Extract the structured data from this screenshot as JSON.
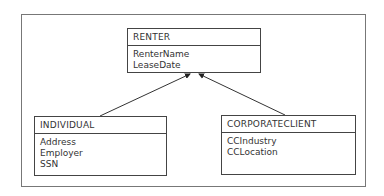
{
  "diagram": {
    "type": "er-inheritance",
    "entities": [
      {
        "name": "RENTER",
        "attributes": [
          "RenterName",
          "LeaseDate"
        ]
      },
      {
        "name": "INDIVIDUAL",
        "attributes": [
          "Address",
          "Employer",
          "SSN"
        ]
      },
      {
        "name": "CORPORATECLIENT",
        "attributes": [
          "CCIndustry",
          "CCLocation"
        ]
      }
    ],
    "relationships": [
      {
        "from": "INDIVIDUAL",
        "to": "RENTER",
        "kind": "generalization"
      },
      {
        "from": "CORPORATECLIENT",
        "to": "RENTER",
        "kind": "generalization"
      }
    ]
  }
}
